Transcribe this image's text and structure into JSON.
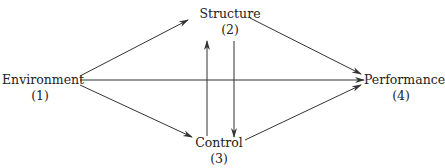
{
  "nodes": {
    "environment": {
      "label": "Environment",
      "number": "(1)"
    },
    "structure": {
      "label": "Structure",
      "number": "(2)"
    },
    "control": {
      "label": "Control",
      "number": "(3)"
    },
    "performance": {
      "label": "Performance",
      "number": "(4)"
    }
  },
  "edges": [
    {
      "from": "Environment",
      "to": "Structure"
    },
    {
      "from": "Environment",
      "to": "Control"
    },
    {
      "from": "Environment",
      "to": "Performance"
    },
    {
      "from": "Structure",
      "to": "Performance"
    },
    {
      "from": "Control",
      "to": "Performance"
    },
    {
      "from": "Control",
      "to": "Structure"
    },
    {
      "from": "Structure",
      "to": "Control"
    }
  ],
  "colors": {
    "line": "#333333",
    "background": "#ffffff"
  }
}
